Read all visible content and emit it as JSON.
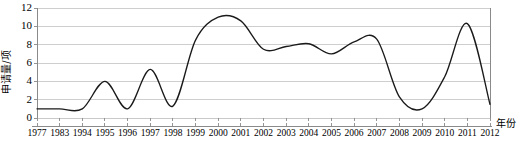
{
  "chart_data": {
    "type": "line",
    "title": "",
    "xlabel": "年份",
    "ylabel": "申请量/项",
    "categories": [
      "1977",
      "1983",
      "1994",
      "1995",
      "1996",
      "1997",
      "1998",
      "1999",
      "2000",
      "2001",
      "2002",
      "2003",
      "2004",
      "2005",
      "2006",
      "2007",
      "2008",
      "2009",
      "2010",
      "2011",
      "2012"
    ],
    "values": [
      1,
      1,
      1,
      4,
      1,
      5.3,
      1.3,
      8.5,
      11,
      10.6,
      7.5,
      7.8,
      8.1,
      7,
      8.3,
      8.6,
      2.3,
      1,
      4.5,
      10.3,
      1.5
    ],
    "ylim": [
      0,
      12
    ],
    "yticks": [
      0,
      2,
      4,
      6,
      8,
      10,
      12
    ],
    "grid": "horizontal",
    "legend": "none",
    "smoothing": "spline",
    "series": [
      {
        "name": "申请量",
        "values": [
          1,
          1,
          1,
          4,
          1,
          5.3,
          1.3,
          8.5,
          11,
          10.6,
          7.5,
          7.8,
          8.1,
          7,
          8.3,
          8.6,
          2.3,
          1,
          4.5,
          10.3,
          1.5
        ]
      }
    ],
    "colors": {
      "line": "#1a1a1a",
      "grid": "#c9c9c9",
      "axis": "#8a8a8a",
      "background": "#ffffff"
    }
  },
  "axis": {
    "y_title": "申请量/项",
    "x_title": "年份",
    "y_tick_labels": [
      "0",
      "2",
      "4",
      "6",
      "8",
      "10",
      "12"
    ],
    "x_tick_labels": [
      "1977",
      "1983",
      "1994",
      "1995",
      "1996",
      "1997",
      "1998",
      "1999",
      "2000",
      "2001",
      "2002",
      "2003",
      "2004",
      "2005",
      "2006",
      "2007",
      "2008",
      "2009",
      "2010",
      "2011",
      "2012"
    ]
  }
}
